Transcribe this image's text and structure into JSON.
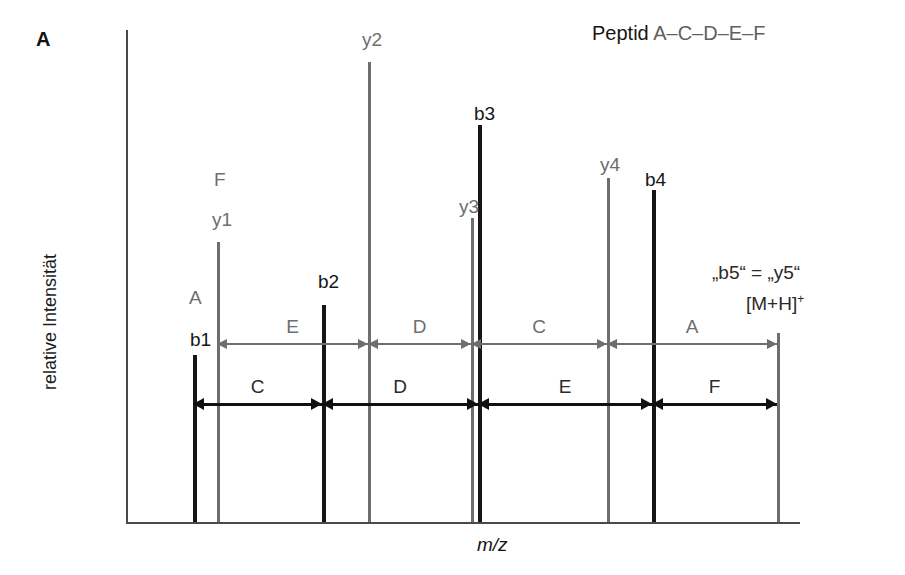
{
  "panel": {
    "label": "A"
  },
  "title": {
    "prefix": "Peptid",
    "sequence": "A–C–D–E–F"
  },
  "axes": {
    "y_label": "relative Intensität",
    "x_label": "m/z",
    "axis_color": "#4a4a4a",
    "origin_x": 126,
    "baseline_y": 522,
    "top_y": 30,
    "right_x": 800
  },
  "annotations": [
    {
      "name": "b5-equals-y5",
      "text": "„b5“ = „y5“",
      "x": 712,
      "y": 262
    },
    {
      "name": "molecular-ion",
      "text": "[M+H]",
      "sup": "+",
      "x": 746,
      "y": 292
    }
  ],
  "colors": {
    "b_series": "#161616",
    "y_series": "#6e6e6e",
    "molecular_ion": "#6e6e6e"
  },
  "chart_data": {
    "type": "bar",
    "title": "Peptid A–C–D–E–F",
    "xlabel": "m/z",
    "ylabel": "relative Intensität",
    "grid": false,
    "legend": "none",
    "axis_ticks": [],
    "categories": [
      "b1",
      "y1",
      "b2",
      "y2",
      "y3",
      "b3",
      "y4",
      "b4",
      "[M+H]+"
    ],
    "series": [
      {
        "name": "b-ions",
        "color": "#161616",
        "points": [
          {
            "label": "b1",
            "x": 193,
            "top": 355,
            "height": 167,
            "width": 4
          },
          {
            "label": "b2",
            "x": 322,
            "top": 305,
            "height": 217,
            "width": 4
          },
          {
            "label": "b3",
            "x": 478,
            "top": 125,
            "height": 397,
            "width": 4
          },
          {
            "label": "b4",
            "x": 652,
            "top": 190,
            "height": 332,
            "width": 4
          }
        ]
      },
      {
        "name": "y-ions",
        "color": "#6e6e6e",
        "points": [
          {
            "label": "y1",
            "x": 217,
            "top": 242,
            "height": 280,
            "width": 3
          },
          {
            "label": "y2",
            "x": 368,
            "top": 62,
            "height": 460,
            "width": 3
          },
          {
            "label": "y3",
            "x": 471,
            "top": 218,
            "height": 304,
            "width": 3
          },
          {
            "label": "y4",
            "x": 607,
            "top": 178,
            "height": 344,
            "width": 3
          }
        ]
      },
      {
        "name": "precursor",
        "color": "#6e6e6e",
        "points": [
          {
            "label": "[M+H]+",
            "x": 777,
            "top": 333,
            "height": 189,
            "width": 3
          }
        ]
      }
    ],
    "peak_labels": [
      {
        "text": "b1",
        "series": "b",
        "x": 190,
        "y": 330
      },
      {
        "text": "y1",
        "series": "y",
        "x": 212,
        "y": 210
      },
      {
        "text": "F",
        "series": "y",
        "x": 214,
        "y": 170
      },
      {
        "text": "A",
        "series": "y",
        "x": 189,
        "y": 288
      },
      {
        "text": "b2",
        "series": "b",
        "x": 318,
        "y": 272
      },
      {
        "text": "y2",
        "series": "y",
        "x": 362,
        "y": 30
      },
      {
        "text": "b3",
        "series": "b",
        "x": 474,
        "y": 104
      },
      {
        "text": "y3",
        "series": "y",
        "x": 459,
        "y": 197
      },
      {
        "text": "y4",
        "series": "y",
        "x": 600,
        "y": 155
      },
      {
        "text": "b4",
        "series": "b",
        "x": 645,
        "y": 170
      }
    ],
    "residue_arrows": [
      {
        "row": "y-series",
        "color": "#6e6e6e",
        "y": 344,
        "segments": [
          {
            "label": "E",
            "from": 217,
            "to": 368
          },
          {
            "label": "D",
            "from": 368,
            "to": 471
          },
          {
            "label": "C",
            "from": 471,
            "to": 607
          },
          {
            "label": "A",
            "from": 607,
            "to": 777
          }
        ]
      },
      {
        "row": "b-series",
        "color": "#101010",
        "y": 404,
        "segments": [
          {
            "label": "C",
            "from": 193,
            "to": 322
          },
          {
            "label": "D",
            "from": 322,
            "to": 478
          },
          {
            "label": "E",
            "from": 478,
            "to": 652
          },
          {
            "label": "F",
            "from": 652,
            "to": 777
          }
        ]
      }
    ]
  }
}
